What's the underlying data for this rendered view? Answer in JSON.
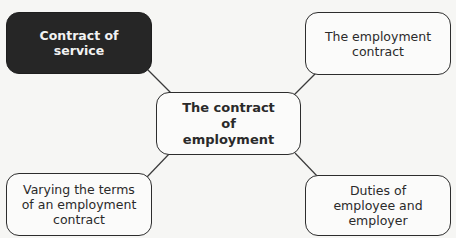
{
  "diagram": {
    "type": "mind-map",
    "center": {
      "label": "The contract of employment"
    },
    "nodes": [
      {
        "id": "service",
        "label": "Contract of service",
        "highlighted": true,
        "position": "top-left"
      },
      {
        "id": "contract",
        "label": "The employment contract",
        "highlighted": false,
        "position": "top-right"
      },
      {
        "id": "varying",
        "label": "Varying the terms of an employment contract",
        "highlighted": false,
        "position": "bottom-left"
      },
      {
        "id": "duties",
        "label": "Duties of employee and employer",
        "highlighted": false,
        "position": "bottom-right"
      }
    ],
    "edges": [
      {
        "from": "center",
        "to": "service"
      },
      {
        "from": "center",
        "to": "contract"
      },
      {
        "from": "center",
        "to": "varying"
      },
      {
        "from": "center",
        "to": "duties"
      }
    ],
    "colors": {
      "highlight_fill": "#262626",
      "highlight_text": "#f2f2f2",
      "node_border": "#2d2d2d",
      "background": "#f6f6f4"
    }
  }
}
